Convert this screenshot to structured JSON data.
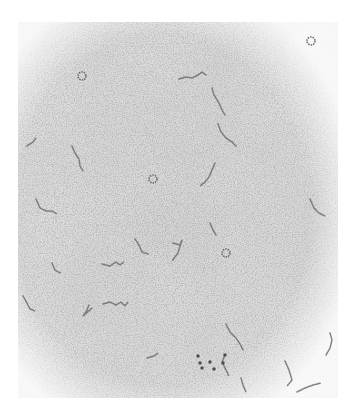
{
  "image": {
    "kind": "electron micrograph",
    "description": "Speckled gray micrograph showing scattered thin beaded strands and a few small ring-shaped particles",
    "background_color": "#ffffff",
    "field_color": "#d9d9d9",
    "field_dark_color": "#c4c4c4",
    "strand_color": "#6f6f6f",
    "field_bounds": {
      "left": 18,
      "top": 22,
      "right": 338,
      "bottom": 398
    }
  },
  "caption": {
    "text": ""
  },
  "features": {
    "rings": [
      {
        "x": 82,
        "y": 76,
        "r": 4
      },
      {
        "x": 311,
        "y": 41,
        "r": 4
      },
      {
        "x": 153,
        "y": 179,
        "r": 4
      },
      {
        "x": 226,
        "y": 253,
        "r": 4
      }
    ],
    "strands": [
      {
        "points": "179,79 186,77 192,78 198,75 202,72 206,75"
      },
      {
        "points": "212,88 214,95 219,103 222,110 225,115"
      },
      {
        "points": "218,124 221,132 226,138 232,142 236,146"
      },
      {
        "points": "215,163 212,170 209,177 205,182 200,186"
      },
      {
        "points": "72,146 75,153 79,159 80,166 83,171"
      },
      {
        "points": "27,146 33,142 36,138"
      },
      {
        "points": "36,199 40,208 46,211 52,211 57,214"
      },
      {
        "points": "135,239 139,245 142,252 148,254"
      },
      {
        "points": "173,243 180,245 182,240 178,253 172,261"
      },
      {
        "points": "102,264 110,266 116,262 120,265 124,262"
      },
      {
        "points": "210,223 213,230 216,235"
      },
      {
        "points": "310,199 314,208 319,213 325,216"
      },
      {
        "points": "52,263 55,270 60,273"
      },
      {
        "points": "103,304 110,302 116,305 121,302 125,306 128,302"
      },
      {
        "points": "23,296 27,303 30,309 35,311"
      },
      {
        "points": "89,305 86,312 83,316 92,308"
      },
      {
        "points": "147,358 154,356 158,353"
      },
      {
        "points": "226,324 230,332 236,338 240,344 243,350"
      },
      {
        "points": "225,355 222,362 226,370 229,376"
      },
      {
        "points": "285,361 289,370 292,380 287,386"
      },
      {
        "points": "297,392 305,388 313,385 321,383"
      },
      {
        "points": "330,333 332,340 330,348 326,355"
      },
      {
        "points": "241,378 243,385 246,392"
      }
    ],
    "dots": [
      {
        "x": 198,
        "y": 356
      },
      {
        "x": 200,
        "y": 363
      },
      {
        "x": 202,
        "y": 368
      },
      {
        "x": 225,
        "y": 355
      },
      {
        "x": 223,
        "y": 363
      },
      {
        "x": 210,
        "y": 362
      },
      {
        "x": 214,
        "y": 369
      }
    ]
  }
}
